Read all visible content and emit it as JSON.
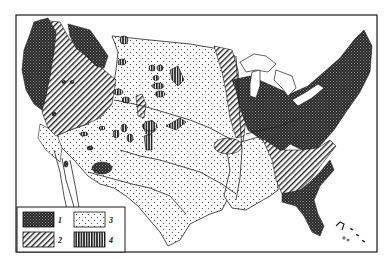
{
  "map": {
    "subject": "United States map with four shaded region classes",
    "colors": {
      "ink": "#1a1a1a",
      "paper": "#ffffff"
    },
    "regions": [
      {
        "class": "1",
        "pattern": "dense-crosshatch",
        "areas": [
          "Pacific Northwest coast",
          "Northern Rockies",
          "Great Lakes and Northeast",
          "Florida"
        ]
      },
      {
        "class": "2",
        "pattern": "diagonal-hatch",
        "areas": [
          "Great Basin / Intermountain West",
          "Upper Mississippi valley",
          "Southeast piedmont",
          "Ozarks"
        ]
      },
      {
        "class": "3",
        "pattern": "dots",
        "areas": [
          "Great Plains",
          "Southwest",
          "Texas",
          "Gulf coastal plain"
        ]
      },
      {
        "class": "4",
        "pattern": "vertical-stripes",
        "areas": [
          "scattered Rocky Mountain patches"
        ]
      }
    ]
  },
  "legend": {
    "items": [
      {
        "label": "1",
        "pattern": "dense-crosshatch"
      },
      {
        "label": "3",
        "pattern": "dots"
      },
      {
        "label": "2",
        "pattern": "diagonal-hatch"
      },
      {
        "label": "4",
        "pattern": "vertical-stripes"
      }
    ]
  }
}
